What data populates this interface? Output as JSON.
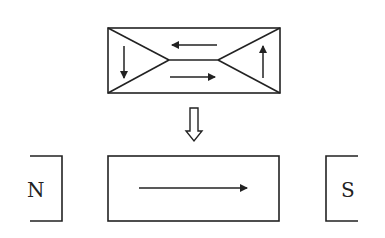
{
  "diagram": {
    "top_block": {
      "description": "Unmagnetized material with closure domains",
      "domains": [
        "down",
        "left",
        "right",
        "up"
      ]
    },
    "transition_arrow": "hollow-down-arrow",
    "bottom_block": {
      "description": "Magnetized material, single domain",
      "domain": "right"
    },
    "poles": {
      "left": "N",
      "right": "S"
    },
    "colors": {
      "line": "#222222",
      "background": "#ffffff"
    }
  }
}
